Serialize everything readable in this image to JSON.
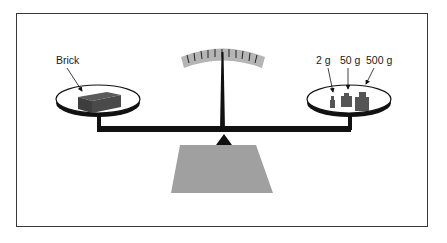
{
  "diagram": {
    "type": "balance-scale",
    "left_pan": {
      "label": "Brick",
      "object": "brick"
    },
    "right_pan": {
      "weights": [
        {
          "label": "2 g"
        },
        {
          "label": "50 g"
        },
        {
          "label": "500 g"
        }
      ]
    },
    "dial": {
      "tick_count": 11
    },
    "colors": {
      "outline": "#111111",
      "brick": "#4a4a4a",
      "weights": "#555555",
      "base": "#a0a0a0",
      "dial": "#b5b5b5"
    }
  }
}
